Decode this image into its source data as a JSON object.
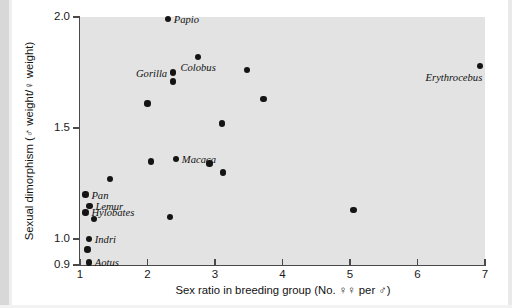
{
  "chart_data": {
    "type": "scatter",
    "title": "",
    "xlabel": "Sex ratio in breeding group (No. ♀♀ per ♂)",
    "ylabel": "Sexual dimorphism (♂ weight/♀ weight)",
    "xlim": [
      1,
      7
    ],
    "ylim": [
      0.9,
      2.0
    ],
    "grid": false,
    "legend": "none",
    "xticks": [
      "1",
      "2",
      "3",
      "4",
      "5",
      "6",
      "7"
    ],
    "yticks": [
      "0.9",
      "1.0",
      "1.5",
      "2.0"
    ],
    "y_axis_note": "non-linear break between 0.9 and 1.0",
    "plot_background": "#e3e3e3",
    "marker_color": "#141414",
    "axis_color": "#4a4a4a",
    "points": [
      {
        "label": "Papio",
        "x": 2.3,
        "y": 1.99,
        "label_pos": "right"
      },
      {
        "label": "Colobus",
        "x": 2.75,
        "y": 1.82,
        "label_pos": "below"
      },
      {
        "label": "Gorilla",
        "x": 2.38,
        "y": 1.75,
        "label_pos": "left"
      },
      {
        "label": "Erythrocebus",
        "x": 6.93,
        "y": 1.78,
        "label_pos": "left-below"
      },
      {
        "label": "",
        "x": 2.38,
        "y": 1.71,
        "label_pos": "none"
      },
      {
        "label": "",
        "x": 3.47,
        "y": 1.76,
        "label_pos": "none"
      },
      {
        "label": "",
        "x": 2.0,
        "y": 1.61,
        "label_pos": "none"
      },
      {
        "label": "",
        "x": 3.72,
        "y": 1.63,
        "label_pos": "none"
      },
      {
        "label": "",
        "x": 3.1,
        "y": 1.52,
        "label_pos": "none"
      },
      {
        "label": "Macaca",
        "x": 2.42,
        "y": 1.36,
        "label_pos": "right"
      },
      {
        "label": "",
        "x": 2.05,
        "y": 1.35,
        "label_pos": "none"
      },
      {
        "label": "",
        "x": 2.92,
        "y": 1.34,
        "label_pos": "none"
      },
      {
        "label": "",
        "x": 3.12,
        "y": 1.3,
        "label_pos": "none"
      },
      {
        "label": "",
        "x": 1.44,
        "y": 1.27,
        "label_pos": "none"
      },
      {
        "label": "Pan",
        "x": 1.08,
        "y": 1.2,
        "label_pos": "right"
      },
      {
        "label": "Lemur",
        "x": 1.14,
        "y": 1.15,
        "label_pos": "right"
      },
      {
        "label": "Hylobates",
        "x": 1.08,
        "y": 1.12,
        "label_pos": "right"
      },
      {
        "label": "",
        "x": 1.21,
        "y": 1.09,
        "label_pos": "none"
      },
      {
        "label": "",
        "x": 2.33,
        "y": 1.1,
        "label_pos": "none"
      },
      {
        "label": "",
        "x": 5.05,
        "y": 1.13,
        "label_pos": "none"
      },
      {
        "label": "Indri",
        "x": 1.13,
        "y": 1.0,
        "label_pos": "right"
      },
      {
        "label": "",
        "x": 1.11,
        "y": 0.96,
        "label_pos": "none"
      },
      {
        "label": "Aotus",
        "x": 1.13,
        "y": 0.91,
        "label_pos": "right"
      }
    ]
  }
}
